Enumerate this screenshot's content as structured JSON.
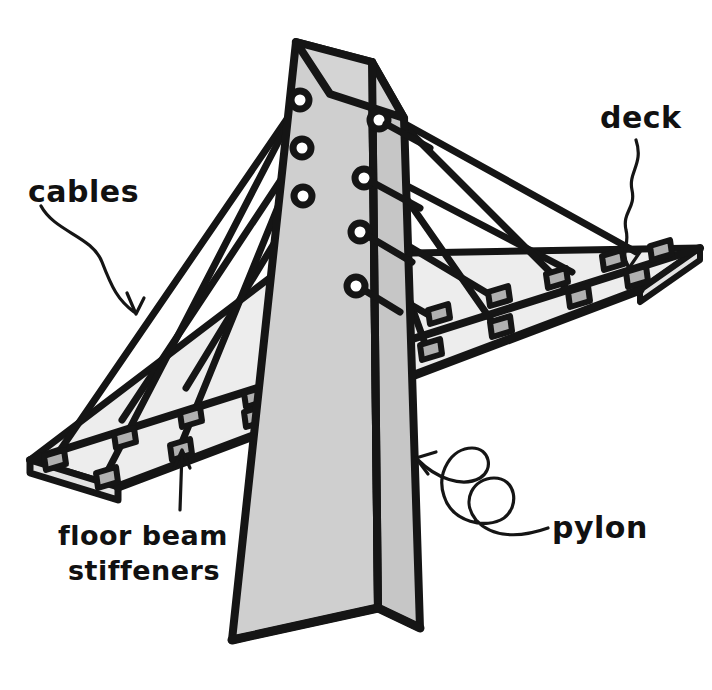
{
  "diagram": {
    "style": "hand-drawn ink sketch, grayscale",
    "background_color": "#ffffff",
    "ink_color": "#151515"
  },
  "labels": {
    "cables": "cables",
    "deck": "deck",
    "pylon": "pylon",
    "floor_beam_line1": "floor beam",
    "floor_beam_line2": "stiffeners"
  },
  "colors": {
    "ink": "#151515",
    "pylon_left_face": "#cfcfcf",
    "pylon_right_face": "#c4c4c4",
    "pylon_top_face": "#d2d2d2",
    "deck_surface": "#ededed",
    "deck_side": "#e3e3e3",
    "shadow_quad": "#6e6e6e",
    "stiffener_block": "#b0b0b0",
    "anchor_ring_fill": "#ffffff",
    "paper": "#ffffff"
  },
  "parts": {
    "pylon": {
      "name": "pylon",
      "description": "tapered rectangular tower, two visible faces, wide at base",
      "faces_visible": 2,
      "anchor_rings_left_face": 3,
      "anchor_rings_right_face": 4,
      "anchor_rings_total": 7
    },
    "deck": {
      "name": "deck",
      "description": "flat roadway slab in perspective, passing through the pylon",
      "near_edge_stiffeners": 9,
      "far_edge_stiffeners": 9
    },
    "cables": {
      "name": "cables",
      "description": "stay cables running from pylon anchor rings down to deck stiffeners",
      "left_span_count": 6,
      "right_span_count": 8,
      "total": 14
    },
    "floor_beam_stiffeners": {
      "name": "floor beam stiffeners",
      "description": "small gray trapezoidal blocks on the deck edges where cables anchor",
      "count": 18
    }
  }
}
